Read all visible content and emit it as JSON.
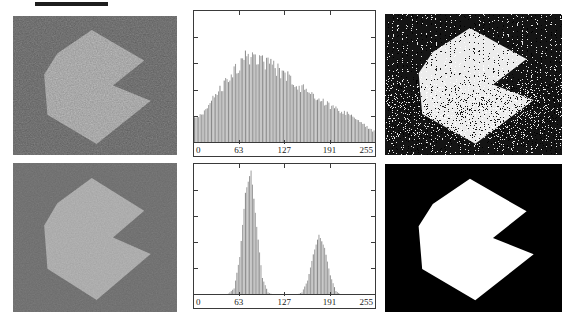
{
  "chart_data": [
    {
      "type": "bar",
      "subtype": "intensity-histogram",
      "panel": "top-center",
      "title": "",
      "xlabel": "",
      "ylabel": "",
      "xlim": [
        0,
        255
      ],
      "ylim": [
        0,
        1
      ],
      "grid": false,
      "legend": "none",
      "texture": "ragged",
      "x_ticks": [
        0,
        63,
        127,
        191,
        255
      ],
      "x_tick_labels": [
        "0",
        "63",
        "127",
        "191",
        "255"
      ],
      "envelope_x_step": 8,
      "envelope": [
        0.18,
        0.22,
        0.26,
        0.31,
        0.37,
        0.43,
        0.5,
        0.55,
        0.6,
        0.64,
        0.66,
        0.65,
        0.62,
        0.6,
        0.57,
        0.54,
        0.51,
        0.48,
        0.45,
        0.42,
        0.39,
        0.36,
        0.33,
        0.31,
        0.28,
        0.26,
        0.24,
        0.22,
        0.2,
        0.17,
        0.14,
        0.11,
        0.08
      ],
      "peak": {
        "center": 84,
        "height": 0.66
      }
    },
    {
      "type": "bar",
      "subtype": "intensity-histogram",
      "panel": "bottom-center",
      "title": "",
      "xlabel": "",
      "ylabel": "",
      "xlim": [
        0,
        255
      ],
      "ylim": [
        0,
        1
      ],
      "grid": false,
      "legend": "none",
      "texture": "smooth",
      "x_ticks": [
        0,
        63,
        127,
        191,
        255
      ],
      "x_tick_labels": [
        "0",
        "63",
        "127",
        "191",
        "255"
      ],
      "envelope_x_step": 8,
      "envelope": [
        0,
        0,
        0,
        0,
        0,
        0,
        0.01,
        0.05,
        0.29,
        0.78,
        0.95,
        0.52,
        0.13,
        0.02,
        0,
        0,
        0,
        0,
        0,
        0.02,
        0.11,
        0.31,
        0.46,
        0.36,
        0.15,
        0.03,
        0,
        0,
        0,
        0,
        0,
        0,
        0
      ],
      "peaks": [
        {
          "center": 78,
          "height": 0.97
        },
        {
          "center": 177,
          "height": 0.46
        }
      ]
    }
  ],
  "panels": {
    "shape_polygon_points": "48,10 80,32 61,50 84,61 51,92 21,71 19,42 27,27",
    "noisy_image": {
      "background": "#6f6f6f",
      "shape_fill": "#b6b6b6",
      "noise": "heavy-grain"
    },
    "thresholded_noisy": {
      "background": "#141414",
      "shape_fill": "#ececec",
      "noise": "salt-pepper"
    },
    "smoothed_image": {
      "background": "#727272",
      "shape_fill": "#b3b3b3",
      "noise": "light-grain"
    },
    "thresholded_clean": {
      "background": "#000000",
      "shape_fill": "#ffffff",
      "noise": "none"
    }
  },
  "colors": {
    "histogram_bar": "#9e9e9e",
    "histogram_bar_dark": "#8a8a8a",
    "axis": "#3a3a3a",
    "label_text": "#1a1a1a",
    "page_background": "#ffffff"
  }
}
